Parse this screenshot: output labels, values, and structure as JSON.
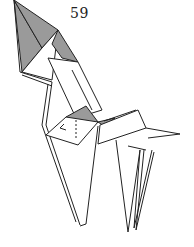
{
  "diagram": {
    "step_number": "59",
    "colors": {
      "paper_white": "#ffffff",
      "paper_shaded": "#9a9a9a",
      "line": "#222222"
    },
    "caption": ""
  }
}
